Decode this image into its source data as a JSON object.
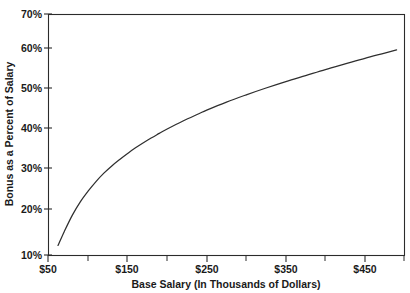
{
  "chart_data": {
    "type": "line",
    "title": "",
    "subtitle": "",
    "xlabel": "Base Salary (In Thousands of Dollars)",
    "ylabel": "Bonus as a Percent of Salary",
    "xlim": [
      50,
      500
    ],
    "ylim": [
      10,
      70
    ],
    "grid": false,
    "legend": null,
    "x_tick_labels": [
      "$50",
      "$150",
      "$250",
      "$350",
      "$450"
    ],
    "x_tick_values": [
      50,
      150,
      250,
      350,
      450
    ],
    "x_minor_tick_values": [
      100,
      200,
      300,
      400,
      500
    ],
    "y_tick_labels": [
      "10%",
      "20%",
      "30%",
      "40%",
      "50%",
      "60%",
      "70%"
    ],
    "y_tick_values": [
      10,
      20,
      30,
      40,
      50,
      60,
      70
    ],
    "series": [
      {
        "name": "Bonus as a Percent of Salary",
        "color": "#2f2f2f",
        "x": [
          62,
          70,
          80,
          90,
          100,
          110,
          120,
          130,
          140,
          150,
          160,
          175,
          190,
          200,
          220,
          240,
          250,
          275,
          300,
          325,
          350,
          375,
          400,
          425,
          450,
          475,
          490
        ],
        "values": [
          12.5,
          16.0,
          20.0,
          23.3,
          26.0,
          28.4,
          30.5,
          32.3,
          33.9,
          35.4,
          36.8,
          38.7,
          40.4,
          41.5,
          43.5,
          45.3,
          46.2,
          48.2,
          50.0,
          51.7,
          53.3,
          54.8,
          56.3,
          57.7,
          59.1,
          60.4,
          61.2
        ]
      }
    ],
    "annotations": []
  },
  "axes": {
    "y_axis_title": "Bonus as a Percent of Salary",
    "x_axis_title": "Base Salary (In Thousands of Dollars)",
    "y_labels": [
      "70%",
      "60%",
      "50%",
      "40%",
      "30%",
      "20%",
      "10%"
    ],
    "x_labels": [
      "$50",
      "$150",
      "$250",
      "$350",
      "$450"
    ]
  },
  "colors": {
    "background": "#ffffff",
    "axis": "#2b2b2b",
    "curve": "#2f2f2f",
    "text": "#1a1a1a"
  }
}
